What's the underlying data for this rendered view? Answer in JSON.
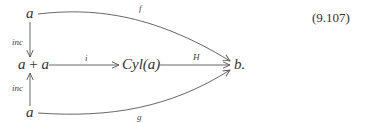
{
  "equation_number": "(9.107)",
  "nodes": {
    "top_a": "a",
    "middle_sum_left": "a",
    "middle_sum_plus": "+",
    "middle_sum_right": "a",
    "cylinder": "Cyl(a)",
    "bottom_a": "a",
    "target": "b."
  },
  "arrows": {
    "f": {
      "label": "f",
      "from": "a (top)",
      "to": "b"
    },
    "inc_top": {
      "label": "inc",
      "from": "a (top)",
      "to": "a + a"
    },
    "inc_bottom": {
      "label": "inc",
      "from": "a (bottom)",
      "to": "a + a"
    },
    "i": {
      "label": "i",
      "from": "a + a",
      "to": "Cyl(a)"
    },
    "H": {
      "label": "H",
      "from": "Cyl(a)",
      "to": "b"
    },
    "g": {
      "label": "g",
      "from": "a (bottom)",
      "to": "b"
    }
  },
  "colors": {
    "stroke": "#555555",
    "text": "#333333"
  }
}
